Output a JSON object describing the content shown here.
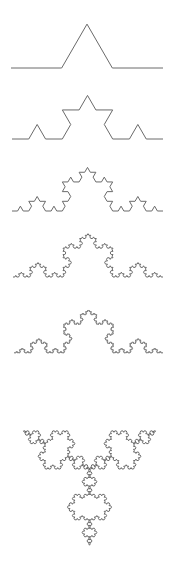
{
  "colors": {
    "background": "#ffffff",
    "stroke": "#6a6a6a"
  },
  "curves": [
    {
      "name": "koch-curve-iteration-1",
      "order": 1,
      "x0": 11,
      "x1": 163,
      "baseline": 68
    },
    {
      "name": "koch-curve-iteration-2",
      "order": 2,
      "x0": 12,
      "x1": 163,
      "baseline": 139
    },
    {
      "name": "koch-curve-iteration-3",
      "order": 3,
      "x0": 12,
      "x1": 163,
      "baseline": 211
    },
    {
      "name": "koch-curve-iteration-4",
      "order": 4,
      "x0": 13,
      "x1": 163,
      "baseline": 277
    },
    {
      "name": "koch-curve-iteration-5",
      "order": 5,
      "x0": 14,
      "x1": 163,
      "baseline": 353
    }
  ],
  "snowflake": {
    "name": "koch-snowflake",
    "order": 4,
    "cx": 89.5,
    "cy": 469,
    "top": 381,
    "bottom": 557
  }
}
